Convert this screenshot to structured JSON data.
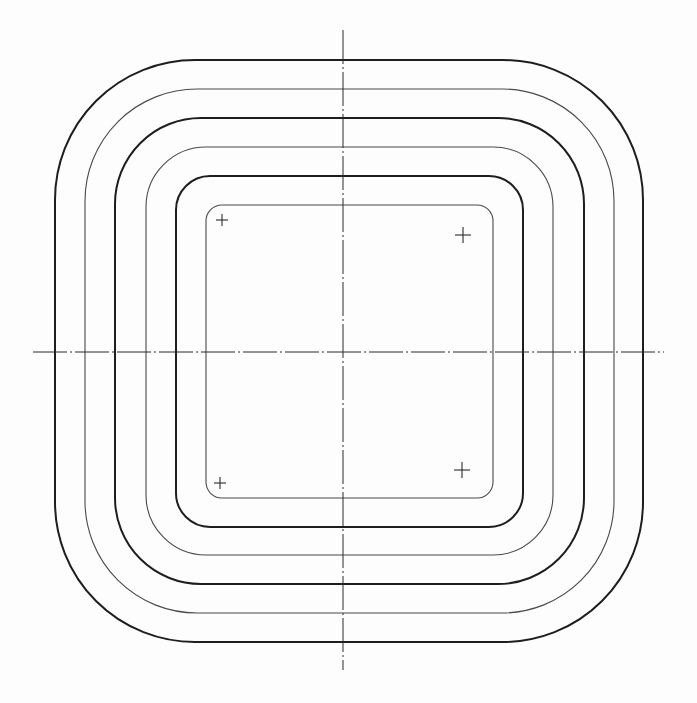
{
  "drawing": {
    "type": "concentric rounded-square contours with centerlines",
    "colors": {
      "background": "#fdfdfd",
      "thick_stroke": "#1e1e1e",
      "thin_stroke": "#4a4a4a",
      "centerline": "#2a2a2a"
    },
    "center": {
      "x": 343,
      "y": 352
    },
    "contours": [
      {
        "id": "contour-1",
        "weight": "thick",
        "left": 55,
        "top": 60,
        "right": 643,
        "bottom": 642,
        "radius": 140
      },
      {
        "id": "contour-2",
        "weight": "thin",
        "left": 85,
        "top": 89,
        "right": 614,
        "bottom": 613,
        "radius": 112
      },
      {
        "id": "contour-3",
        "weight": "thick",
        "left": 115,
        "top": 118,
        "right": 584,
        "bottom": 584,
        "radius": 86
      },
      {
        "id": "contour-4",
        "weight": "thin",
        "left": 146,
        "top": 147,
        "right": 553,
        "bottom": 555,
        "radius": 60
      },
      {
        "id": "contour-5",
        "weight": "thick",
        "left": 176,
        "top": 176,
        "right": 523,
        "bottom": 527,
        "radius": 34
      },
      {
        "id": "contour-6",
        "weight": "thin",
        "left": 206,
        "top": 205,
        "right": 493,
        "bottom": 498,
        "radius": 16
      }
    ],
    "centerlines": {
      "horizontal": {
        "x1": 33,
        "x2": 664,
        "y": 352
      },
      "vertical": {
        "x": 343,
        "y1": 30,
        "y2": 670
      }
    },
    "cross_marks": [
      {
        "id": "cross-top-left",
        "x": 222,
        "y": 220,
        "size": 6
      },
      {
        "id": "cross-top-right",
        "x": 463,
        "y": 235,
        "size": 8
      },
      {
        "id": "cross-bottom-left",
        "x": 220,
        "y": 483,
        "size": 6
      },
      {
        "id": "cross-bottom-right",
        "x": 462,
        "y": 470,
        "size": 8
      }
    ]
  }
}
